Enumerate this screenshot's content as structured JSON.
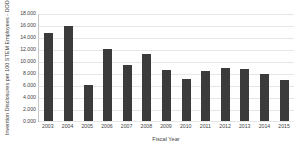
{
  "chart_data": {
    "type": "bar",
    "title": "",
    "xlabel": "Fiscal Year",
    "ylabel": "Invention Disclosures per 100 STEM Employees - DOD",
    "categories": [
      "2003",
      "2004",
      "2005",
      "2006",
      "2007",
      "2008",
      "2009",
      "2010",
      "2011",
      "2012",
      "2013",
      "2014",
      "2015"
    ],
    "values": [
      14.6,
      15.8,
      6.0,
      12.0,
      9.3,
      11.2,
      8.5,
      7.0,
      8.3,
      8.9,
      8.6,
      7.9,
      6.9
    ],
    "ylim": [
      0,
      18
    ],
    "ytick_values": [
      0,
      2,
      4,
      6,
      8,
      10,
      12,
      14,
      16,
      18
    ],
    "ytick_labels": [
      "0.000",
      "2.000",
      "4.000",
      "6.000",
      "8.000",
      "10.000",
      "12.000",
      "14.000",
      "16.000",
      "18.000"
    ],
    "grid": true,
    "legend": false,
    "legend_position": "none",
    "bar_color": "#3b3b3b",
    "grid_color": "#e6e6e6",
    "axis_color": "#a8a8a8"
  }
}
